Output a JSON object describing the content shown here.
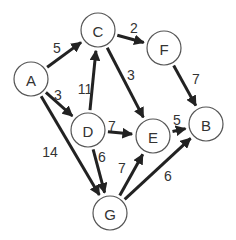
{
  "graph": {
    "nodes": [
      {
        "id": "A",
        "label": "A",
        "x": 31,
        "y": 79
      },
      {
        "id": "C",
        "label": "C",
        "x": 98,
        "y": 30
      },
      {
        "id": "F",
        "label": "F",
        "x": 164,
        "y": 48
      },
      {
        "id": "D",
        "label": "D",
        "x": 88,
        "y": 130
      },
      {
        "id": "E",
        "label": "E",
        "x": 153,
        "y": 136
      },
      {
        "id": "B",
        "label": "B",
        "x": 206,
        "y": 124
      },
      {
        "id": "G",
        "label": "G",
        "x": 110,
        "y": 213
      }
    ],
    "edges": [
      {
        "from": "A",
        "to": "C",
        "weight": "5",
        "lx": 57,
        "ly": 48
      },
      {
        "from": "A",
        "to": "D",
        "weight": "3",
        "lx": 58,
        "ly": 95
      },
      {
        "from": "A",
        "to": "G",
        "weight": "14",
        "lx": 50,
        "ly": 152
      },
      {
        "from": "D",
        "to": "C",
        "weight": "11",
        "lx": 85,
        "ly": 89
      },
      {
        "from": "C",
        "to": "F",
        "weight": "2",
        "lx": 134,
        "ly": 28
      },
      {
        "from": "C",
        "to": "E",
        "weight": "3",
        "lx": 131,
        "ly": 75
      },
      {
        "from": "F",
        "to": "B",
        "weight": "7",
        "lx": 196,
        "ly": 79
      },
      {
        "from": "D",
        "to": "E",
        "weight": "7",
        "lx": 112,
        "ly": 126
      },
      {
        "from": "E",
        "to": "B",
        "weight": "5",
        "lx": 177,
        "ly": 120
      },
      {
        "from": "D",
        "to": "G",
        "weight": "6",
        "lx": 102,
        "ly": 157
      },
      {
        "from": "G",
        "to": "E",
        "weight": "7",
        "lx": 122,
        "ly": 168
      },
      {
        "from": "G",
        "to": "B",
        "weight": "6",
        "lx": 168,
        "ly": 176
      }
    ]
  },
  "colors": {
    "edge": "#222222",
    "node_stroke": "#555555",
    "text": "#333333"
  }
}
